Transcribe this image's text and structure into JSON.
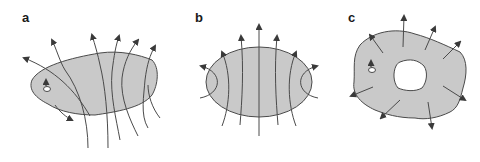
{
  "figure": {
    "panels": [
      {
        "id": "a",
        "label": "a"
      },
      {
        "id": "b",
        "label": "b"
      },
      {
        "id": "c",
        "label": "c"
      }
    ]
  },
  "colors": {
    "fill": "#c9c9c9",
    "stroke": "#4a4a4a",
    "hole": "#ffffff",
    "text": "#1a1a1a"
  }
}
